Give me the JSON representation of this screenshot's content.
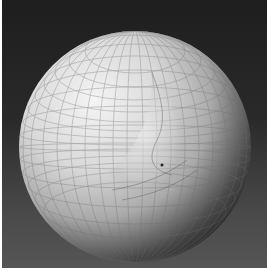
{
  "image": {
    "subject": "3D rendered wireframe sphere with deformation",
    "background_color_top": "#1e1e1e",
    "background_color_bottom": "#555555",
    "sphere_highlight": "#f2f2f2",
    "sphere_mid": "#bcbcbc",
    "sphere_shadow": "#181818",
    "grid_line_color": "#7a7a7a"
  }
}
